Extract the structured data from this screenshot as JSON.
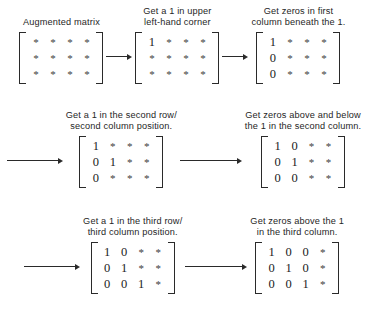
{
  "figure": {
    "star_symbol": "*",
    "matrix_rows": 3,
    "matrix_cols": 4,
    "ink_color": "#1b1b1b",
    "background_color": "#ffffff"
  },
  "steps": [
    {
      "id": "step-1",
      "caption": "Augmented matrix",
      "matrix": [
        [
          "*",
          "*",
          "*",
          "*"
        ],
        [
          "*",
          "*",
          "*",
          "*"
        ],
        [
          "*",
          "*",
          "*",
          "*"
        ]
      ]
    },
    {
      "id": "step-2",
      "caption": "Get a 1 in upper\nleft-hand corner",
      "matrix": [
        [
          "1",
          "*",
          "*",
          "*"
        ],
        [
          "*",
          "*",
          "*",
          "*"
        ],
        [
          "*",
          "*",
          "*",
          "*"
        ]
      ]
    },
    {
      "id": "step-3",
      "caption": "Get zeros in first\ncolumn beneath the 1.",
      "matrix": [
        [
          "1",
          "*",
          "*",
          "*"
        ],
        [
          "0",
          "*",
          "*",
          "*"
        ],
        [
          "0",
          "*",
          "*",
          "*"
        ]
      ]
    },
    {
      "id": "step-4",
      "caption": "Get a 1 in the second row/\nsecond column position.",
      "matrix": [
        [
          "1",
          "*",
          "*",
          "*"
        ],
        [
          "0",
          "1",
          "*",
          "*"
        ],
        [
          "0",
          "*",
          "*",
          "*"
        ]
      ]
    },
    {
      "id": "step-5",
      "caption": "Get zeros above and below\nthe 1 in the second column.",
      "matrix": [
        [
          "1",
          "0",
          "*",
          "*"
        ],
        [
          "0",
          "1",
          "*",
          "*"
        ],
        [
          "0",
          "0",
          "*",
          "*"
        ]
      ]
    },
    {
      "id": "step-6",
      "caption": "Get a 1 in the third row/\nthird column position.",
      "matrix": [
        [
          "1",
          "0",
          "*",
          "*"
        ],
        [
          "0",
          "1",
          "*",
          "*"
        ],
        [
          "0",
          "0",
          "1",
          "*"
        ]
      ]
    },
    {
      "id": "step-7",
      "caption": "Get zeros above the 1\nin the third column.",
      "matrix": [
        [
          "1",
          "0",
          "0",
          "*"
        ],
        [
          "0",
          "1",
          "0",
          "*"
        ],
        [
          "0",
          "0",
          "1",
          "*"
        ]
      ]
    }
  ]
}
